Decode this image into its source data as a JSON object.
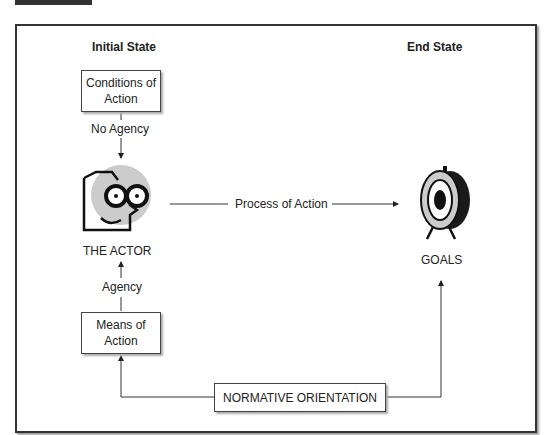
{
  "headers": {
    "initial": "Initial State",
    "end": "End State"
  },
  "boxes": {
    "conditions": "Conditions of Action",
    "means": "Means of Action",
    "normative": "NORMATIVE ORIENTATION"
  },
  "labels": {
    "no_agency": "No Agency",
    "agency": "Agency",
    "process": "Process of Action",
    "actor": "THE ACTOR",
    "goals": "GOALS"
  },
  "colors": {
    "line": "#333333",
    "face_bg": "#cccccc",
    "target_dark": "#1a1a1a"
  }
}
